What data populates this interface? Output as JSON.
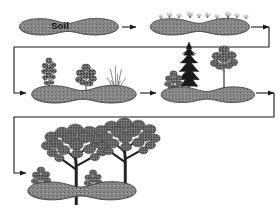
{
  "figure": {
    "type": "ecological-succession-diagram",
    "title": "",
    "background_color": "#ffffff",
    "line_color": "#1a1a1a",
    "soil_fill": "#8a8a8a",
    "soil_edge": "#3d3d3d",
    "vegetation_color": "#4a4a4a",
    "conifer_color": "#1c1c1c"
  },
  "labels": {
    "soil": "Soil"
  },
  "stages": [
    {
      "id": "stage-1-bare-soil",
      "label": "Soil",
      "order": 1,
      "row": 1,
      "vegetation": "none",
      "description": "bare soil mound"
    },
    {
      "id": "stage-2-pioneer-grasses",
      "label": "",
      "order": 2,
      "row": 1,
      "vegetation": "grasses",
      "description": "sparse pioneer grasses and small herbs"
    },
    {
      "id": "stage-3-shrubs-grasses",
      "label": "",
      "order": 3,
      "row": 2,
      "vegetation": "shrubs",
      "description": "shrubs and grass clumps"
    },
    {
      "id": "stage-4-young-trees",
      "label": "",
      "order": 4,
      "row": 2,
      "vegetation": "young-trees",
      "description": "young conifer and broadleaf saplings with shrub"
    },
    {
      "id": "stage-5-mature-forest",
      "label": "",
      "order": 5,
      "row": 3,
      "vegetation": "mature-forest",
      "description": "mature broadleaf trees with understory shrubs"
    }
  ],
  "connectors": [
    {
      "id": "arrow-stage1-stage2",
      "kind": "straight-arrow",
      "from": "stage-1-bare-soil",
      "to": "stage-2-pioneer-grasses",
      "direction": "right"
    },
    {
      "id": "arrow-stage2-stage3",
      "kind": "wrap-arrow",
      "from": "stage-2-pioneer-grasses",
      "to": "stage-3-shrubs-grasses",
      "direction": "right-down-left-right"
    },
    {
      "id": "arrow-stage3-stage4",
      "kind": "straight-arrow",
      "from": "stage-3-shrubs-grasses",
      "to": "stage-4-young-trees",
      "direction": "right"
    },
    {
      "id": "arrow-stage4-stage5",
      "kind": "wrap-arrow",
      "from": "stage-4-young-trees",
      "to": "stage-5-mature-forest",
      "direction": "right-down-left-right"
    }
  ]
}
